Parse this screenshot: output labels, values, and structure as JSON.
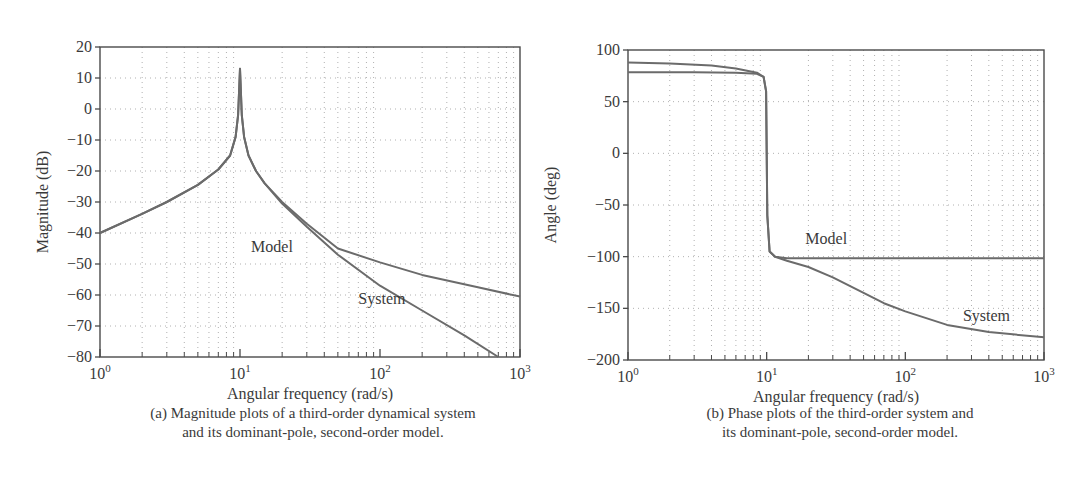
{
  "chart_data": [
    {
      "type": "line",
      "id": "magnitude",
      "title": "",
      "xlabel": "Angular frequency (rad/s)",
      "ylabel": "Magnitude (dB)",
      "xscale": "log",
      "xlim": [
        1,
        1000
      ],
      "ylim": [
        -80,
        20
      ],
      "grid": true,
      "xticks": [
        1,
        10,
        100,
        1000
      ],
      "xtick_labels": [
        [
          "10",
          "0"
        ],
        [
          "10",
          "1"
        ],
        [
          "10",
          "2"
        ],
        [
          "10",
          "3"
        ]
      ],
      "yticks": [
        20,
        10,
        0,
        -10,
        -20,
        -30,
        -40,
        -50,
        -60,
        -70,
        -80
      ],
      "ytick_labels": [
        "20",
        "10",
        "0",
        "−10",
        "−20",
        "−30",
        "−40",
        "−50",
        "−60",
        "−70",
        "−80"
      ],
      "series": [
        {
          "name": "Model",
          "label_pos": [
            12,
            -46
          ],
          "x": [
            1,
            2,
            3,
            5,
            7,
            8.5,
            9.3,
            9.7,
            10,
            10.3,
            10.7,
            11.5,
            13,
            15,
            20,
            30,
            50,
            100,
            200,
            500,
            1000
          ],
          "y": [
            -40,
            -33.8,
            -30,
            -24.5,
            -19.5,
            -15,
            -9,
            -2,
            13,
            -2,
            -9,
            -15,
            -20,
            -24,
            -30,
            -37,
            -45,
            -49.5,
            -53.5,
            -57.5,
            -60.5
          ]
        },
        {
          "name": "System",
          "label_pos": [
            70,
            -63
          ],
          "x": [
            1,
            2,
            3,
            5,
            7,
            8.5,
            9.3,
            9.7,
            10,
            10.3,
            10.7,
            11.5,
            13,
            15,
            20,
            30,
            50,
            100,
            200,
            400,
            700
          ],
          "y": [
            -40,
            -33.8,
            -30,
            -24.5,
            -19.5,
            -15,
            -9,
            -2,
            13,
            -2,
            -9,
            -15,
            -20,
            -24,
            -30.5,
            -38,
            -47,
            -57,
            -65,
            -73,
            -80
          ]
        }
      ],
      "caption": [
        "(a) Magnitude plots of a third-order dynamical system",
        "and its dominant-pole, second-order model."
      ]
    },
    {
      "type": "line",
      "id": "phase",
      "title": "",
      "xlabel": "Angular frequency (rad/s)",
      "ylabel": "Angle (deg)",
      "xscale": "log",
      "xlim": [
        1,
        1000
      ],
      "ylim": [
        -200,
        100
      ],
      "grid": true,
      "xticks": [
        1,
        10,
        100,
        1000
      ],
      "xtick_labels": [
        [
          "10",
          "0"
        ],
        [
          "10",
          "1"
        ],
        [
          "10",
          "2"
        ],
        [
          "10",
          "3"
        ]
      ],
      "yticks": [
        100,
        50,
        0,
        -50,
        -100,
        -150,
        -200
      ],
      "ytick_labels": [
        "100",
        "50",
        "0",
        "−50",
        "−100",
        "−150",
        "−200"
      ],
      "series": [
        {
          "name": "Model",
          "label_pos": [
            19,
            -88
          ],
          "x": [
            1,
            3,
            6,
            8.5,
            9.5,
            9.9,
            10,
            10.1,
            10.5,
            11.5,
            14,
            20,
            50,
            100,
            1000
          ],
          "y": [
            78.5,
            78.5,
            78,
            77,
            74,
            60,
            0,
            -60,
            -95,
            -100,
            -101.5,
            -101.5,
            -101.5,
            -101.5,
            -101.5
          ]
        },
        {
          "name": "System",
          "label_pos": [
            260,
            -162
          ],
          "x": [
            1,
            2,
            4,
            6,
            8.5,
            9.5,
            9.9,
            10,
            10.1,
            10.5,
            11.5,
            14,
            20,
            30,
            50,
            70,
            100,
            200,
            400,
            1000
          ],
          "y": [
            88,
            87,
            85,
            82,
            78,
            74,
            60,
            0,
            -60,
            -95,
            -100,
            -104,
            -110,
            -120,
            -135,
            -145,
            -153,
            -166,
            -173,
            -178
          ]
        }
      ],
      "caption": [
        "(b) Phase plots of the third-order system and",
        "its dominant-pole, second-order model."
      ]
    }
  ],
  "layout_colors": {
    "curve": "#6b6b6b",
    "axis": "#4a4a4a",
    "grid": "#b0b0b0"
  }
}
